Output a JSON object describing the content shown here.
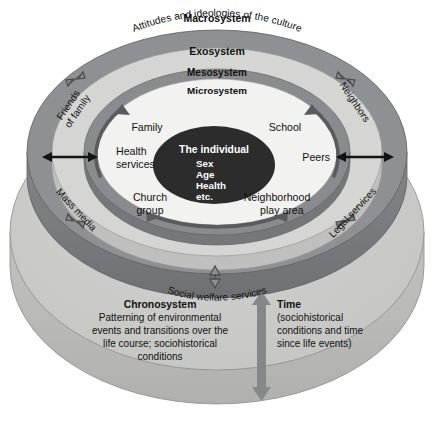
{
  "diagram": {
    "colors": {
      "macrosystem_ring": "#8f9093",
      "macrosystem_side": "#7d7e81",
      "exosystem_ring": "#d3d4d2",
      "mesosystem_ring": "#8a8b8e",
      "microsystem_fill": "#f2f2f0",
      "individual_fill": "#2c2c2c",
      "chronosystem_fill": "#c9cac7",
      "chronosystem_side": "#b5b6b3",
      "arrow_gray": "#7a7b7e",
      "text": "#111111"
    },
    "rings": [
      {
        "key": "macrosystem",
        "label": "Macrosystem",
        "sublabel": "Attitudes and ideologies of the culture"
      },
      {
        "key": "exosystem",
        "label": "Exosystem",
        "sublabel": ""
      },
      {
        "key": "mesosystem",
        "label": "Mesosystem",
        "sublabel": ""
      },
      {
        "key": "microsystem",
        "label": "Microsystem",
        "sublabel": ""
      }
    ],
    "individual": {
      "heading": "The individual",
      "attributes": [
        "Sex",
        "Age",
        "Health",
        "etc."
      ]
    },
    "microsystem_items": [
      {
        "key": "family",
        "label": "Family"
      },
      {
        "key": "school",
        "label": "School"
      },
      {
        "key": "health-services",
        "label": "Health\nservices",
        "line1": "Health",
        "line2": "services"
      },
      {
        "key": "peers",
        "label": "Peers"
      },
      {
        "key": "church-group",
        "label": "Church\ngroup",
        "line1": "Church",
        "line2": "group"
      },
      {
        "key": "neighborhood-play-area",
        "label": "Neighborhood\nplay area",
        "line1": "Neighborhood",
        "line2": "play area"
      }
    ],
    "exosystem_items": [
      {
        "key": "friends-of-family",
        "label": "Friends",
        "line2": "of family"
      },
      {
        "key": "neighbors",
        "label": "Neighbors"
      },
      {
        "key": "mass-media",
        "label": "Mass media"
      },
      {
        "key": "legal-services",
        "label": "Legal services"
      },
      {
        "key": "social-welfare-services",
        "label": "Social welfare services"
      }
    ],
    "chronosystem": {
      "label": "Chronosystem",
      "description_lines": [
        "Patterning of environmental",
        "events and transitions over the",
        "life course; sociohistorical",
        "conditions"
      ]
    },
    "time": {
      "label": "Time",
      "description_lines": [
        "(sociohistorical",
        "conditions and time",
        "since life events)"
      ]
    }
  }
}
